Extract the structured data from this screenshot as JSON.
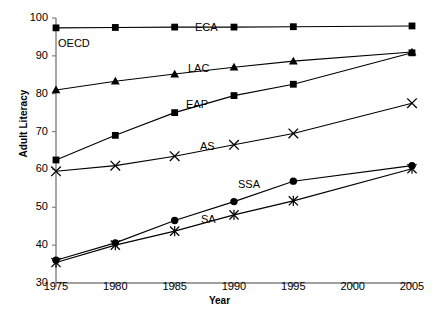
{
  "chart_data": {
    "type": "line",
    "title": "",
    "xlabel": "Year",
    "ylabel": "Adult Literacy",
    "xlim": [
      1975,
      2005
    ],
    "ylim": [
      30,
      100
    ],
    "ytick_labels": [
      "30",
      "40",
      "50",
      "60",
      "70",
      "80",
      "90",
      "100"
    ],
    "yticks": [
      30,
      40,
      50,
      60,
      70,
      80,
      90,
      100
    ],
    "xtick_labels": [
      "1975",
      "1980",
      "1985",
      "1990",
      "1995",
      "2000",
      "2005"
    ],
    "xticks": [
      1975,
      1980,
      1985,
      1990,
      1995,
      2000,
      2005
    ],
    "grid": false,
    "legend_position": "inline-labels",
    "series": [
      {
        "name": "ECA",
        "label": "ECA",
        "marker": "square",
        "x": [
          1975,
          1980,
          1985,
          1990,
          1995,
          2005
        ],
        "values": [
          97.4,
          97.5,
          97.6,
          97.6,
          97.7,
          97.9
        ]
      },
      {
        "name": "LAC",
        "label": "LAC",
        "marker": "triangle",
        "x": [
          1975,
          1980,
          1985,
          1990,
          1995,
          2005
        ],
        "values": [
          81.0,
          83.3,
          85.2,
          87.0,
          88.6,
          91.0
        ]
      },
      {
        "name": "EAP",
        "label": "EAP",
        "marker": "square",
        "x": [
          1975,
          1980,
          1985,
          1990,
          1995,
          2005
        ],
        "values": [
          62.5,
          69.0,
          75.0,
          79.5,
          82.5,
          90.8
        ]
      },
      {
        "name": "AS",
        "label": "AS",
        "marker": "cross",
        "x": [
          1975,
          1980,
          1985,
          1990,
          1995,
          2005
        ],
        "values": [
          59.5,
          61.0,
          63.5,
          66.5,
          69.5,
          77.5
        ]
      },
      {
        "name": "SSA",
        "label": "SSA",
        "marker": "circle",
        "x": [
          1975,
          1980,
          1985,
          1990,
          1995,
          2005
        ],
        "values": [
          36.0,
          40.6,
          46.5,
          51.5,
          56.9,
          61.0
        ]
      },
      {
        "name": "SA",
        "label": "SA",
        "marker": "star",
        "x": [
          1975,
          1980,
          1985,
          1990,
          1995,
          2005
        ],
        "values": [
          35.4,
          40.0,
          43.7,
          48.0,
          51.7,
          60.2
        ]
      },
      {
        "name": "OECD",
        "label": "OECD",
        "marker": "none",
        "x": [],
        "values": []
      }
    ],
    "inline_labels": [
      {
        "text": "ECA",
        "x": 195,
        "y": 22
      },
      {
        "text": "OECD",
        "x": 58,
        "y": 38
      },
      {
        "text": "LAC",
        "x": 188,
        "y": 63
      },
      {
        "text": "EAP",
        "x": 186,
        "y": 99
      },
      {
        "text": "AS",
        "x": 200,
        "y": 141
      },
      {
        "text": "SSA",
        "x": 238,
        "y": 179
      },
      {
        "text": "SA",
        "x": 201,
        "y": 214
      }
    ],
    "series_colors": {
      "line": "#000000",
      "marker": "#000000",
      "axis": "#808080"
    }
  }
}
